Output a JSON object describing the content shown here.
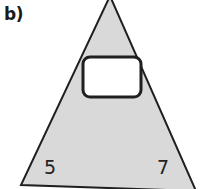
{
  "figure": {
    "panel_label": "b)",
    "background_color": "#ffffff",
    "shape": {
      "name": "triangle",
      "fill_color": "#d9d9d9",
      "stroke_color": "#1f1f1f",
      "stroke_width": 2,
      "apex": {
        "x": 110,
        "y": -4
      },
      "bottom_left": {
        "x": 21,
        "y": 183
      },
      "bottom_right": {
        "x": 196,
        "y": 189
      }
    },
    "cutout": {
      "name": "rounded-rectangle",
      "fill_color": "#ffffff",
      "stroke_color": "#1f1f1f",
      "stroke_width": 3,
      "x": 83,
      "y": 57,
      "width": 58,
      "height": 40,
      "corner_radius": 7
    },
    "labels": {
      "left_side": "5",
      "right_side": "7"
    }
  }
}
